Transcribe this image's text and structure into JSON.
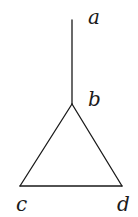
{
  "diagram": {
    "type": "graph",
    "nodes": [
      {
        "id": "a",
        "label": "a",
        "x": 72,
        "y": 20,
        "label_x": 88,
        "label_y": 24
      },
      {
        "id": "b",
        "label": "b",
        "x": 72,
        "y": 104,
        "label_x": 88,
        "label_y": 106
      },
      {
        "id": "c",
        "label": "c",
        "x": 20,
        "y": 186,
        "label_x": 16,
        "label_y": 211
      },
      {
        "id": "d",
        "label": "d",
        "x": 122,
        "y": 186,
        "label_x": 117,
        "label_y": 211
      }
    ],
    "edges": [
      {
        "from": "a",
        "to": "b"
      },
      {
        "from": "b",
        "to": "c"
      },
      {
        "from": "b",
        "to": "d"
      },
      {
        "from": "c",
        "to": "d"
      }
    ],
    "colors": {
      "stroke": "#1a1a1a",
      "background": "#ffffff"
    }
  }
}
